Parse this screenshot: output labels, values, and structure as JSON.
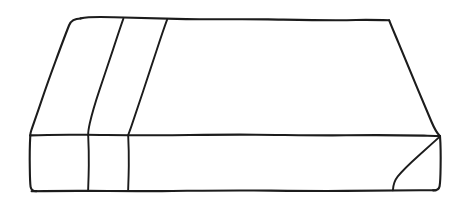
{
  "image": {
    "kind": "line-drawing",
    "subject": "hand-drawn 3d rectangular block / slab in oblique projection",
    "background_color": "#ffffff",
    "ink_color": "#1c1c1c",
    "stroke_width_px": 2,
    "width_px": 463,
    "height_px": 206,
    "text_content": "",
    "labels": []
  },
  "geometry": {
    "top_face": {
      "name": "top-face",
      "points": "80,18 389,20 440,135 30,135",
      "path": "M80,18 C86,16 96,16.5 112,17 C150,18.2 210,19.2 270,19.6 C320,19.9 362,20.1 389,20.2 L401,47 L414,76 L427,106 L440,135.5 L360,135.2 L250,134.6 L150,135.0 L80,135.2 L30,135.4 L42,106 L55,76 L68,46 Z"
    },
    "front_face": {
      "name": "front-face",
      "points": "30,135 440,135 440,190 31,191"
    },
    "top_edge": {
      "name": "top-back-edge",
      "from": [
        80,
        18
      ],
      "to": [
        389,
        20
      ]
    },
    "left_slant_edge": {
      "name": "top-left-slant-edge",
      "from": [
        80,
        18
      ],
      "to": [
        30,
        135
      ]
    },
    "right_slant_edge": {
      "name": "top-right-slant-edge",
      "from": [
        389,
        20
      ],
      "to": [
        440,
        135
      ]
    },
    "middle_horizontal_edge": {
      "name": "top-front-edge",
      "from": [
        30,
        135
      ],
      "to": [
        440,
        136
      ]
    },
    "bottom_edge": {
      "name": "bottom-front-edge",
      "from": [
        31,
        191
      ],
      "to": [
        436,
        190
      ]
    },
    "left_vertical_edge": {
      "name": "front-left-vertical-edge",
      "from": [
        30,
        135
      ],
      "to": [
        31,
        191
      ]
    },
    "right_vertical_edge": {
      "name": "front-right-vertical-edge",
      "from": [
        440,
        136
      ],
      "to": [
        439,
        186
      ]
    },
    "top_division_line_1": {
      "name": "top-face-division-line-1",
      "from": [
        123,
        18
      ],
      "to": [
        88,
        135
      ]
    },
    "top_division_line_2": {
      "name": "top-face-division-line-2",
      "from": [
        167,
        19
      ],
      "to": [
        128,
        135
      ]
    },
    "front_division_line_1": {
      "name": "front-face-division-line-1",
      "from": [
        88,
        135
      ],
      "to": [
        88,
        191
      ]
    },
    "front_division_line_2": {
      "name": "front-face-division-line-2",
      "from": [
        128,
        135
      ],
      "to": [
        128,
        191
      ]
    },
    "corner_diagonal": {
      "name": "front-right-corner-diagonal",
      "from": [
        440,
        136
      ],
      "to": [
        393,
        190
      ]
    }
  }
}
